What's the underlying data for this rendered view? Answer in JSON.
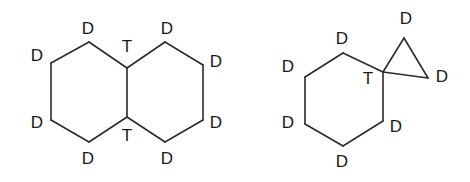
{
  "figure": {
    "title": "",
    "background_color": "#ffffff",
    "bond_color": "#2b2b2b",
    "label_color": "#1a1a1a",
    "structures": [
      {
        "name": "fused-bicyclic-structure",
        "description": "decalin-like fused bicyclic ring system",
        "ring_count": 2,
        "labels": [
          {
            "id": "left-top-d",
            "text": "D",
            "x": 88,
            "y": 30
          },
          {
            "id": "left-upper-left-d",
            "text": "D",
            "x": 37,
            "y": 57
          },
          {
            "id": "left-lower-left-d",
            "text": "D",
            "x": 37,
            "y": 124
          },
          {
            "id": "left-bottom-d",
            "text": "D",
            "x": 88,
            "y": 160
          },
          {
            "id": "left-bridge-top-t",
            "text": "T",
            "x": 127,
            "y": 48
          },
          {
            "id": "left-bridge-bottom-t",
            "text": "T",
            "x": 127,
            "y": 137
          },
          {
            "id": "right-top-d",
            "text": "D",
            "x": 167,
            "y": 30
          },
          {
            "id": "right-upper-right-d",
            "text": "D",
            "x": 216,
            "y": 63
          },
          {
            "id": "right-lower-right-d",
            "text": "D",
            "x": 216,
            "y": 124
          },
          {
            "id": "right-bottom-d",
            "text": "D",
            "x": 167,
            "y": 160
          }
        ],
        "bonds": [
          {
            "id": "b1",
            "x1": 51,
            "y1": 63,
            "x2": 89,
            "y2": 42
          },
          {
            "id": "b2",
            "x1": 89,
            "y1": 42,
            "x2": 127,
            "y2": 68
          },
          {
            "id": "b3",
            "x1": 51,
            "y1": 63,
            "x2": 51,
            "y2": 120
          },
          {
            "id": "b4",
            "x1": 51,
            "y1": 120,
            "x2": 89,
            "y2": 142
          },
          {
            "id": "b5",
            "x1": 89,
            "y1": 142,
            "x2": 127,
            "y2": 117
          },
          {
            "id": "b6",
            "x1": 127,
            "y1": 68,
            "x2": 127,
            "y2": 117
          },
          {
            "id": "b7",
            "x1": 127,
            "y1": 68,
            "x2": 165,
            "y2": 42
          },
          {
            "id": "b8",
            "x1": 165,
            "y1": 42,
            "x2": 203,
            "y2": 65
          },
          {
            "id": "b9",
            "x1": 203,
            "y1": 65,
            "x2": 203,
            "y2": 120
          },
          {
            "id": "b10",
            "x1": 203,
            "y1": 120,
            "x2": 165,
            "y2": 142
          },
          {
            "id": "b11",
            "x1": 165,
            "y1": 142,
            "x2": 127,
            "y2": 117
          }
        ]
      },
      {
        "name": "spiro-cyclopropane-structure",
        "description": "cyclohexane ring spiro-fused to a cyclopropane ring",
        "ring_count": 2,
        "labels": [
          {
            "id": "hex-top-d",
            "text": "D",
            "x": 342,
            "y": 40
          },
          {
            "id": "hex-upper-left-d",
            "text": "D",
            "x": 288,
            "y": 68
          },
          {
            "id": "hex-lower-left-d",
            "text": "D",
            "x": 288,
            "y": 124
          },
          {
            "id": "hex-bottom-d",
            "text": "D",
            "x": 342,
            "y": 163
          },
          {
            "id": "hex-lower-right-d",
            "text": "D",
            "x": 396,
            "y": 128
          },
          {
            "id": "spiro-t",
            "text": "T",
            "x": 368,
            "y": 80
          },
          {
            "id": "cp-top-d",
            "text": "D",
            "x": 406,
            "y": 20
          },
          {
            "id": "cp-right-d",
            "text": "D",
            "x": 442,
            "y": 78
          }
        ],
        "bonds": [
          {
            "id": "r1",
            "x1": 305,
            "y1": 77,
            "x2": 343,
            "y2": 53
          },
          {
            "id": "r2",
            "x1": 343,
            "y1": 53,
            "x2": 383,
            "y2": 72
          },
          {
            "id": "r3",
            "x1": 305,
            "y1": 77,
            "x2": 305,
            "y2": 124
          },
          {
            "id": "r4",
            "x1": 305,
            "y1": 124,
            "x2": 343,
            "y2": 146
          },
          {
            "id": "r5",
            "x1": 343,
            "y1": 146,
            "x2": 383,
            "y2": 121
          },
          {
            "id": "r6",
            "x1": 383,
            "y1": 121,
            "x2": 383,
            "y2": 72
          },
          {
            "id": "r7",
            "x1": 383,
            "y1": 72,
            "x2": 404,
            "y2": 38
          },
          {
            "id": "r8",
            "x1": 404,
            "y1": 38,
            "x2": 428,
            "y2": 78
          },
          {
            "id": "r9",
            "x1": 428,
            "y1": 78,
            "x2": 383,
            "y2": 72
          }
        ]
      }
    ]
  }
}
